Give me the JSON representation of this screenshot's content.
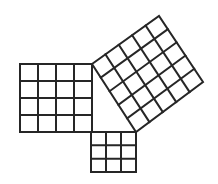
{
  "diagram": {
    "stroke_color": "#262626",
    "background": "#ffffff",
    "squares": [
      {
        "name": "square-a",
        "grid": 4,
        "corners": [
          [
            20,
            64
          ],
          [
            92,
            64
          ],
          [
            92,
            132
          ],
          [
            20,
            132
          ]
        ]
      },
      {
        "name": "square-b",
        "grid": 3,
        "corners": [
          [
            91,
            132
          ],
          [
            136,
            132
          ],
          [
            136,
            172
          ],
          [
            91,
            172
          ]
        ]
      },
      {
        "name": "square-c",
        "grid": 5,
        "corners": [
          [
            92,
            64
          ],
          [
            159,
            16
          ],
          [
            203,
            82
          ],
          [
            136,
            132
          ]
        ]
      }
    ]
  }
}
